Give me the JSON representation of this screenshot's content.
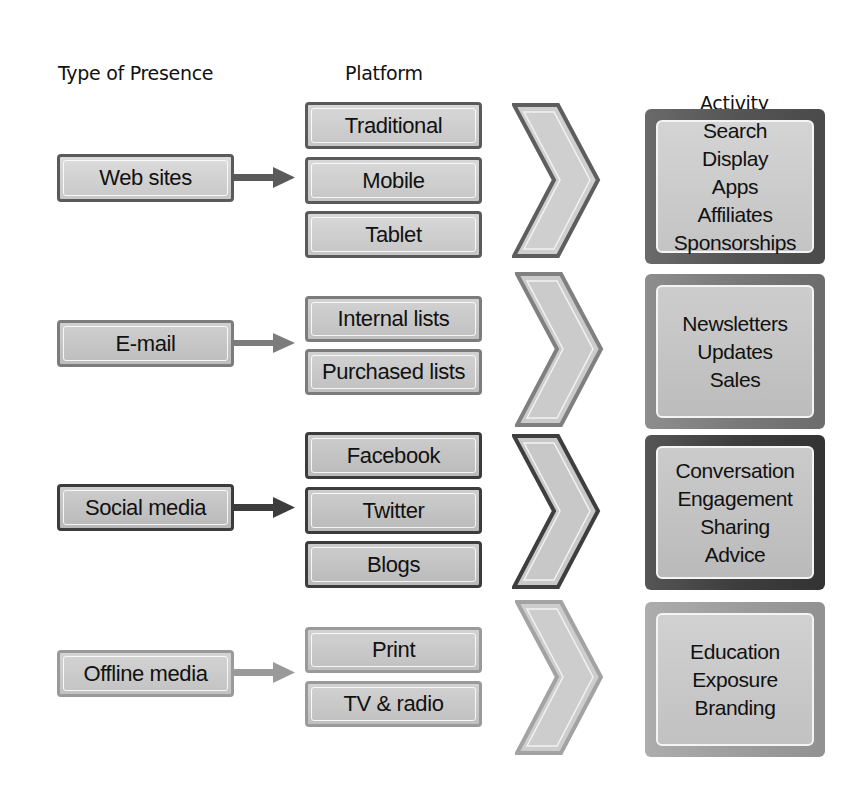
{
  "headers": {
    "type_of_presence": "Type of Presence",
    "platform": "Platform",
    "activity": "Activity"
  },
  "rows": [
    {
      "presence": "Web sites",
      "platforms": [
        "Traditional",
        "Mobile",
        "Tablet"
      ],
      "activities": [
        "Search",
        "Display",
        "Apps",
        "Affiliates",
        "Sponsorships"
      ],
      "border_color": "#5a5a5a"
    },
    {
      "presence": "E-mail",
      "platforms": [
        "Internal lists",
        "Purchased lists"
      ],
      "activities": [
        "Newsletters",
        "Updates",
        "Sales"
      ],
      "border_color": "#7c7c7c"
    },
    {
      "presence": "Social media",
      "platforms": [
        "Facebook",
        "Twitter",
        "Blogs"
      ],
      "activities": [
        "Conversation",
        "Engagement",
        "Sharing",
        "Advice"
      ],
      "border_color": "#3c3c3c"
    },
    {
      "presence": "Offline media",
      "platforms": [
        "Print",
        "TV & radio"
      ],
      "activities": [
        "Education",
        "Exposure",
        "Branding"
      ],
      "border_color": "#9a9a9a"
    }
  ],
  "icons": {
    "connector": "right-arrow-icon",
    "flow": "chevron-right-icon"
  }
}
